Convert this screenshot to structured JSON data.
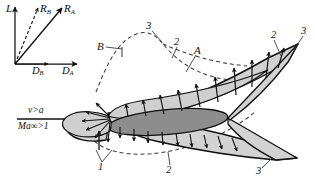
{
  "figure": {
    "name": "supersonic-airfoil-pressure-distribution",
    "background": "#ffffff",
    "ink": "#111111",
    "fill_light": "#d2d2d2",
    "fill_dark": "#8f8f8f",
    "width": 315,
    "height": 178
  },
  "vector_inset": {
    "lift": {
      "label": "L",
      "sub": ""
    },
    "resultant_b": {
      "label": "R",
      "sub": "B"
    },
    "resultant_a": {
      "label": "R",
      "sub": "A"
    },
    "drag_b": {
      "label": "D",
      "sub": "B"
    },
    "drag_a": {
      "label": "D",
      "sub": "A"
    }
  },
  "flow": {
    "velocity_condition": "v>a",
    "mach_condition": "Ma∞>1"
  },
  "callouts": {
    "region_a": "A",
    "region_b": "B",
    "one": "1",
    "two_left_bottom": "2",
    "two_upper_left": "2",
    "two_upper_right": "2",
    "three_top": "3",
    "three_upper_right": "3",
    "three_bottom_right": "3"
  }
}
